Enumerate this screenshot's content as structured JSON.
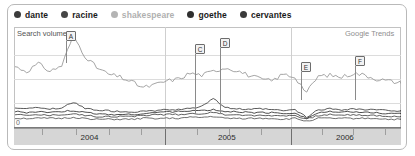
{
  "legend": {
    "items": [
      {
        "label": "dante",
        "color": "#3c3c3c",
        "dot": "legend-dot"
      },
      {
        "label": "racine",
        "color": "#454545",
        "dot": "legend-dot"
      },
      {
        "label": "shakespeare",
        "color": "#b4b4b4",
        "dot": "legend-dot"
      },
      {
        "label": "goethe",
        "color": "#2f2f2f",
        "dot": "legend-dot"
      },
      {
        "label": "cervantes",
        "color": "#3a3a3a",
        "dot": "legend-dot"
      }
    ]
  },
  "plot": {
    "y_axis_label": "Search volume",
    "watermark": "Google Trends",
    "zero_label": "0"
  },
  "markers": [
    {
      "letter": "A",
      "x": 66,
      "y": 31,
      "stem": 22
    },
    {
      "letter": "C",
      "x": 195,
      "y": 44,
      "stem": 60
    },
    {
      "letter": "D",
      "x": 220,
      "y": 38,
      "stem": 66
    },
    {
      "letter": "E",
      "x": 301,
      "y": 62,
      "stem": 28
    },
    {
      "letter": "F",
      "x": 355,
      "y": 56,
      "stem": 34
    }
  ],
  "axis": {
    "years": [
      {
        "label": "2004",
        "center_pct": 19.5
      },
      {
        "label": "2005",
        "center_pct": 55.0
      },
      {
        "label": "2006",
        "center_pct": 85.5
      }
    ],
    "year_dividers_pct": [
      39.0,
      71.5
    ],
    "quarter_ticks_pct": [
      7.2,
      16.0,
      24.5,
      32.9,
      47.3,
      55.6,
      63.9,
      79.5,
      87.7,
      95.9
    ]
  },
  "chart_data": {
    "type": "line",
    "title": "Search volume",
    "xlabel": "",
    "ylabel": "Search volume",
    "xlim": [
      "2003-08",
      "2006-06"
    ],
    "ylim": [
      0,
      100
    ],
    "grid": true,
    "legend_position": "top",
    "annotations": [
      {
        "letter": "A",
        "x": "2003-11"
      },
      {
        "letter": "C",
        "x": "2004-11"
      },
      {
        "letter": "D",
        "x": "2005-01"
      },
      {
        "letter": "E",
        "x": "2005-07"
      },
      {
        "letter": "F",
        "x": "2005-12"
      }
    ],
    "x": [
      "2003-08",
      "2003-09",
      "2003-10",
      "2003-11",
      "2003-12",
      "2004-01",
      "2004-02",
      "2004-03",
      "2004-04",
      "2004-05",
      "2004-06",
      "2004-07",
      "2004-08",
      "2004-09",
      "2004-10",
      "2004-11",
      "2004-12",
      "2005-01",
      "2005-02",
      "2005-03",
      "2005-04",
      "2005-05",
      "2005-06",
      "2005-07",
      "2005-08",
      "2005-09",
      "2005-10",
      "2005-11",
      "2005-12",
      "2006-01",
      "2006-02",
      "2006-03",
      "2006-04",
      "2006-05"
    ],
    "series": [
      {
        "name": "shakespeare",
        "color": "#9a9a9a",
        "values": [
          63,
          58,
          66,
          58,
          64,
          95,
          74,
          62,
          55,
          52,
          47,
          41,
          44,
          48,
          50,
          56,
          54,
          58,
          62,
          59,
          54,
          50,
          48,
          55,
          52,
          36,
          53,
          54,
          52,
          56,
          54,
          50,
          48,
          46
        ]
      },
      {
        "name": "dante",
        "color": "#3c3c3c",
        "values": [
          20,
          19,
          20,
          19,
          20,
          26,
          19,
          18,
          17,
          16,
          16,
          16,
          17,
          18,
          18,
          19,
          22,
          30,
          20,
          19,
          18,
          19,
          18,
          17,
          18,
          10,
          18,
          19,
          18,
          19,
          18,
          18,
          17,
          17
        ]
      },
      {
        "name": "goethe",
        "color": "#2f2f2f",
        "values": [
          16,
          15,
          16,
          15,
          16,
          17,
          15,
          14,
          13,
          13,
          13,
          14,
          15,
          16,
          16,
          17,
          17,
          18,
          16,
          16,
          15,
          15,
          15,
          14,
          15,
          9,
          15,
          16,
          15,
          16,
          15,
          15,
          14,
          14
        ]
      },
      {
        "name": "racine",
        "color": "#454545",
        "values": [
          13,
          12,
          13,
          12,
          13,
          14,
          12,
          11,
          11,
          11,
          11,
          12,
          13,
          13,
          13,
          14,
          14,
          15,
          13,
          13,
          12,
          12,
          12,
          12,
          12,
          8,
          12,
          13,
          12,
          13,
          12,
          12,
          11,
          11
        ]
      },
      {
        "name": "cervantes",
        "color": "#565656",
        "values": [
          9,
          9,
          9,
          9,
          9,
          10,
          9,
          8,
          8,
          8,
          8,
          9,
          9,
          9,
          9,
          10,
          10,
          11,
          9,
          9,
          9,
          9,
          9,
          8,
          9,
          6,
          9,
          9,
          9,
          9,
          9,
          9,
          8,
          8
        ]
      }
    ]
  }
}
